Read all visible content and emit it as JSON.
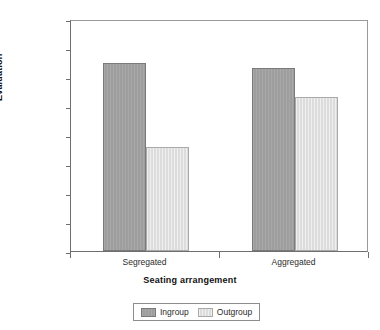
{
  "chart_data": {
    "type": "bar",
    "title": "",
    "xlabel": "Seating arrangement",
    "ylabel": "Evaluation",
    "categories": [
      "Segregated",
      "Aggregated"
    ],
    "series": [
      {
        "name": "Ingroup",
        "values": [
          5.62,
          5.58
        ],
        "color": "#9e9e9e"
      },
      {
        "name": "Outgroup",
        "values": [
          4.9,
          5.33
        ],
        "color": "#dcdcdc"
      }
    ],
    "ylim": [
      4,
      6
    ],
    "ytick_labels": [
      "6",
      "5.75",
      "5.5",
      "5.25",
      "5",
      "4.75",
      "4.5",
      "4.25",
      "4"
    ],
    "ytick_values": [
      6,
      5.75,
      5.5,
      5.25,
      5,
      4.75,
      4.5,
      4.25,
      4
    ],
    "grid": false,
    "legend_position": "bottom"
  },
  "axes": {
    "y_title": "Evaluation",
    "x_title": "Seating arrangement"
  },
  "legend": {
    "entries": [
      {
        "label": "Ingroup",
        "color": "#9e9e9e"
      },
      {
        "label": "Outgroup",
        "color": "#dcdcdc"
      }
    ]
  }
}
